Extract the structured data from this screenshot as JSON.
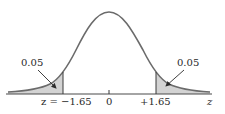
{
  "diagram": {
    "type": "normal-distribution-two-tailed",
    "colors": {
      "curve": "#6b6b6b",
      "axis": "#4a4a4a",
      "shade": "#d3d3d3",
      "text": "#2a2a2a",
      "background": "#ffffff"
    },
    "left_tail": {
      "area_label": "0.05",
      "cutoff_label": "z = −1.65"
    },
    "right_tail": {
      "area_label": "0.05",
      "cutoff_label": "+1.65"
    },
    "center_label": "0",
    "axis_label": "z"
  }
}
